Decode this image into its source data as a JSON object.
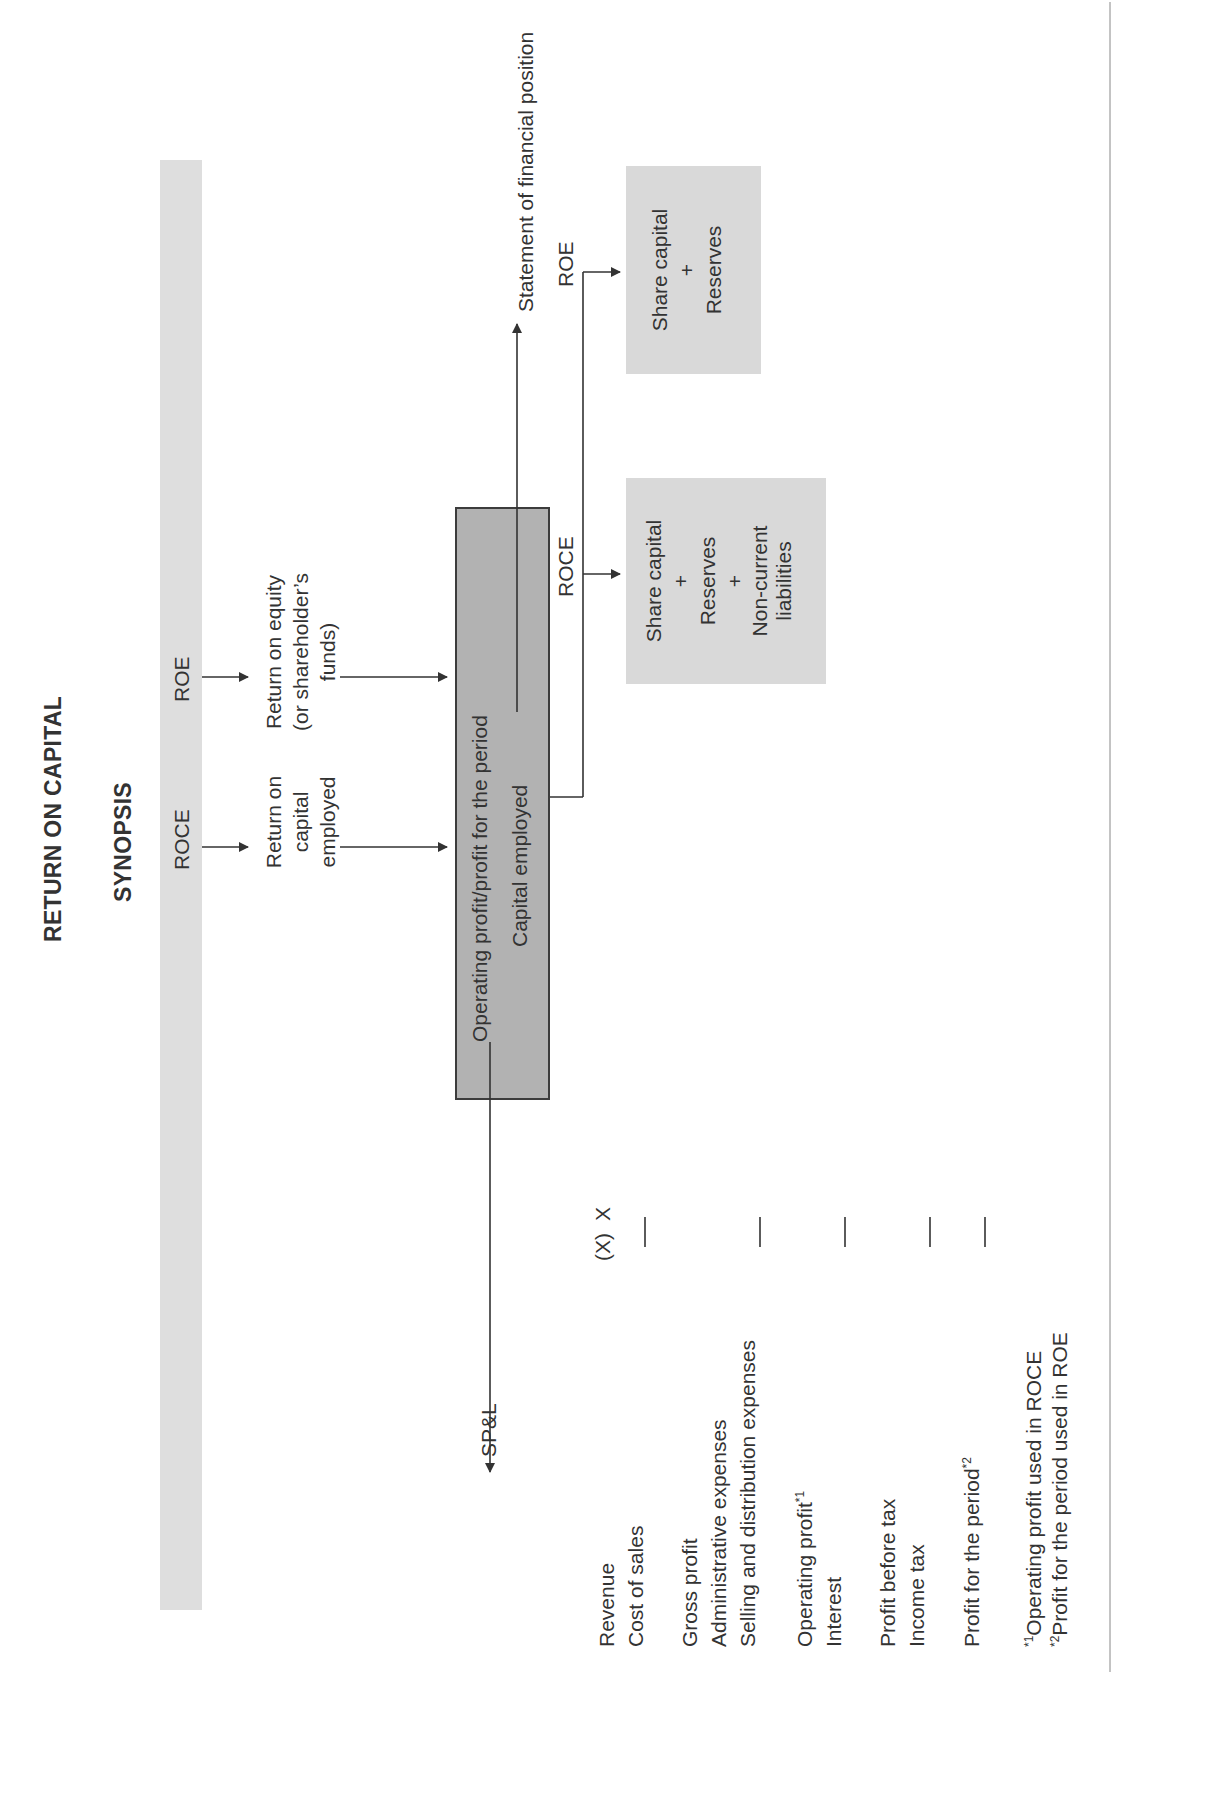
{
  "header": {
    "title": "RETURN ON CAPITAL",
    "subtitle": "SYNOPSIS"
  },
  "band": {
    "roce_label": "ROCE",
    "roe_label": "ROE",
    "color": "#dedede"
  },
  "definitions": {
    "roce": [
      "Return on",
      "capital",
      "employed"
    ],
    "roe": [
      "Return on equity",
      "(or shareholder’s",
      "funds)"
    ]
  },
  "formula_box": {
    "numerator": "Operating profit/profit for the period",
    "denominator": "Capital employed",
    "color": "#b2b2b2"
  },
  "statement_of_financial_position": {
    "label": "Statement of financial position",
    "roce_branch_label": "ROCE",
    "roe_branch_label": "ROE",
    "roce_box": [
      "Share capital",
      "+",
      "Reserves",
      "+",
      "Non-current",
      "liabilities"
    ],
    "roe_box": [
      "Share capital",
      "+",
      "Reserves"
    ],
    "box_color": "#d9d9d9"
  },
  "spl": {
    "label": "SP&L",
    "rows": [
      {
        "label": "Revenue",
        "value": "X"
      },
      {
        "label": "Cost of sales",
        "value": "(X)"
      },
      {
        "label": "Gross profit",
        "value": "X"
      },
      {
        "label": "Administrative expenses",
        "value": "(X)"
      },
      {
        "label": "Selling and distribution expenses",
        "value": "(X)"
      },
      {
        "label": "Operating profit",
        "sup": "*1",
        "value": "X"
      },
      {
        "label": "Interest",
        "value": "(X)"
      },
      {
        "label": "Profit before tax",
        "value": "X"
      },
      {
        "label": "Income tax",
        "value": "(X)"
      },
      {
        "label": "Profit for the period",
        "sup": "*2",
        "value": "X"
      }
    ]
  },
  "footnotes": [
    {
      "mark": "*1",
      "text": "Operating profit used in ROCE"
    },
    {
      "mark": "*2",
      "text": "Profit for the period used in ROE"
    }
  ]
}
